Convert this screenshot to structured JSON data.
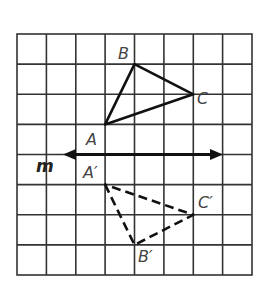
{
  "diagram": {
    "grid": {
      "columns": 8,
      "rows": 8
    },
    "line": {
      "label": "m"
    },
    "triangle_original": {
      "style": "solid",
      "vertices": [
        {
          "label": "A",
          "col": 3,
          "row": 3
        },
        {
          "label": "B",
          "col": 4,
          "row": 1
        },
        {
          "label": "C",
          "col": 6,
          "row": 2
        }
      ]
    },
    "triangle_image": {
      "style": "dashed",
      "vertices": [
        {
          "label": "A′",
          "col": 3,
          "row": 5
        },
        {
          "label": "B′",
          "col": 4,
          "row": 7
        },
        {
          "label": "C′",
          "col": 6,
          "row": 6
        }
      ]
    }
  }
}
